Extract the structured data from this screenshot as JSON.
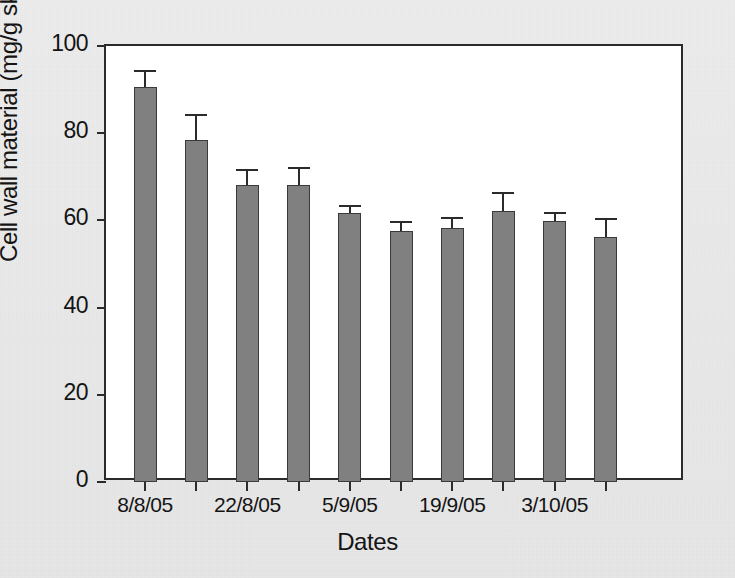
{
  "chart_data": {
    "type": "bar",
    "title": "",
    "xlabel": "Dates",
    "ylabel": "Cell wall material (mg/g skin)",
    "ylim": [
      0,
      100
    ],
    "yticks": [
      0,
      20,
      40,
      60,
      80,
      100
    ],
    "ytick_labels": [
      "0",
      "20",
      "40",
      "60",
      "80",
      "100"
    ],
    "grid": false,
    "legend": null,
    "bar_color": "#808080",
    "edge_color": "#3a3a3a",
    "error_color": "#2b2b2b",
    "categories": [
      "8/8/05",
      "",
      "22/8/05",
      "",
      "5/9/05",
      "",
      "19/9/05",
      "",
      "3/10/05",
      ""
    ],
    "xtick_labels": [
      "8/8/05",
      "22/8/05",
      "5/9/05",
      "19/9/05",
      "3/10/05"
    ],
    "values": [
      90.6,
      78.4,
      68.1,
      68.1,
      61.7,
      57.5,
      58.3,
      62.2,
      59.8,
      56.2
    ],
    "errors": [
      3.9,
      5.9,
      3.7,
      4.1,
      1.8,
      2.4,
      2.4,
      4.2,
      2.2,
      4.3
    ],
    "bars": [
      {
        "index": 1,
        "value": 90.6,
        "error": 3.9
      },
      {
        "index": 2,
        "value": 78.4,
        "error": 5.9
      },
      {
        "index": 3,
        "value": 68.1,
        "error": 3.7
      },
      {
        "index": 4,
        "value": 68.1,
        "error": 4.1
      },
      {
        "index": 5,
        "value": 61.7,
        "error": 1.8
      },
      {
        "index": 6,
        "value": 57.5,
        "error": 2.4
      },
      {
        "index": 7,
        "value": 58.3,
        "error": 2.4
      },
      {
        "index": 8,
        "value": 62.2,
        "error": 4.2
      },
      {
        "index": 9,
        "value": 59.8,
        "error": 2.2
      },
      {
        "index": 10,
        "value": 56.2,
        "error": 4.3
      }
    ]
  }
}
